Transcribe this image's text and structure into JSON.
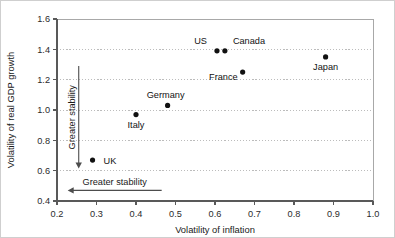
{
  "chart_data": {
    "type": "scatter",
    "title": "",
    "xlabel": "Volatility of inflation",
    "ylabel": "Volatility of real GDP growth",
    "xlim": [
      0.2,
      1.0
    ],
    "ylim": [
      0.4,
      1.6
    ],
    "xticks": [
      "0.2",
      "0.3",
      "0.4",
      "0.5",
      "0.6",
      "0.7",
      "0.8",
      "0.9",
      "1.0"
    ],
    "yticks": [
      "0.4",
      "0.6",
      "0.8",
      "1.0",
      "1.2",
      "1.4",
      "1.6"
    ],
    "xtick_values": [
      0.2,
      0.3,
      0.4,
      0.5,
      0.6,
      0.7,
      0.8,
      0.9,
      1.0
    ],
    "ytick_values": [
      0.4,
      0.6,
      0.8,
      1.0,
      1.2,
      1.4,
      1.6
    ],
    "grid": "horizontal-dotted",
    "legend": "none",
    "marker_color": "#111111",
    "points": [
      {
        "name": "UK",
        "x": 0.29,
        "y": 0.67,
        "label_dx": 11,
        "label_dy": 3.5,
        "label_anchor": "start"
      },
      {
        "name": "Italy",
        "x": 0.4,
        "y": 0.97,
        "label_dx": 0,
        "label_dy": 13.5,
        "label_anchor": "middle"
      },
      {
        "name": "Germany",
        "x": 0.48,
        "y": 1.03,
        "label_dx": -2,
        "label_dy": -7,
        "label_anchor": "middle"
      },
      {
        "name": "US",
        "x": 0.605,
        "y": 1.39,
        "label_dx": -10,
        "label_dy": -6.5,
        "label_anchor": "end"
      },
      {
        "name": "Canada",
        "x": 0.625,
        "y": 1.39,
        "label_dx": 8,
        "label_dy": -6.5,
        "label_anchor": "start"
      },
      {
        "name": "France",
        "x": 0.67,
        "y": 1.25,
        "label_dx": -5,
        "label_dy": 8,
        "label_anchor": "end"
      },
      {
        "name": "Japan",
        "x": 0.88,
        "y": 1.35,
        "label_dx": 0,
        "label_dy": 13,
        "label_anchor": "middle"
      }
    ],
    "annotations": [
      {
        "id": "vertical-stability-arrow",
        "text": "Greater stability",
        "orientation": "vertical",
        "direction": "down",
        "x": 0.255,
        "y_from": 1.29,
        "y_to": 0.615
      },
      {
        "id": "horizontal-stability-arrow",
        "text": "Greater stability",
        "orientation": "horizontal",
        "direction": "left",
        "y": 0.47,
        "x_from": 0.465,
        "x_to": 0.227
      }
    ]
  }
}
